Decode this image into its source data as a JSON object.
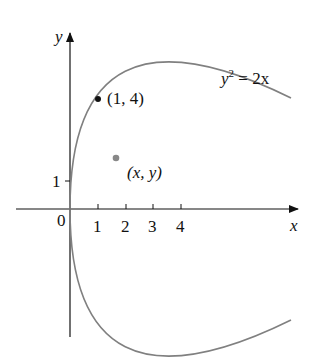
{
  "figure": {
    "equation": {
      "lhs": "y",
      "sup": "2",
      "rhs": " = 2x"
    },
    "axes": {
      "x_label": "x",
      "y_label": "y",
      "origin_label": "0",
      "x_ticks": [
        "1",
        "2",
        "3",
        "4"
      ],
      "y_ticks": [
        "1"
      ]
    },
    "points": [
      {
        "label": "(1, 4)",
        "x": 1,
        "y": 4,
        "color": "#111111"
      },
      {
        "label": "(x, y)",
        "x": 1.67,
        "y": 1.83,
        "color": "#888888"
      }
    ],
    "curve_color": "#808080",
    "axis_color": "#111111"
  }
}
